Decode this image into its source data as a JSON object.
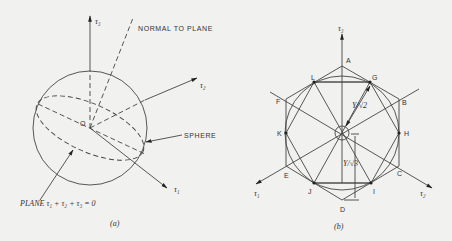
{
  "figure_a": {
    "caption": "(a)",
    "labels": {
      "tau3": "τ₃",
      "tau2": "τ₂",
      "tau1": "τ₁",
      "origin": "O",
      "normal": "NORMAL TO PLANE",
      "sphere": "SPHERE",
      "plane": "PLANE τ₁ + τ₂ + τ₃ = 0"
    }
  },
  "figure_b": {
    "caption": "(b)",
    "labels": {
      "tau3": "τ₃",
      "tau1": "τ₁",
      "tau2": "τ₂",
      "sqrt2": "Y/√2",
      "sqrt3": "Y/√3"
    },
    "hexagon_vertices": [
      "A",
      "B",
      "C",
      "D",
      "E",
      "F"
    ],
    "octagon_points": [
      "G",
      "H",
      "I",
      "J",
      "K",
      "L"
    ]
  }
}
